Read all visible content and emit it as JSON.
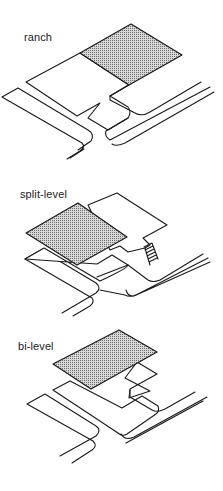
{
  "figure": {
    "panels": [
      {
        "label": "ranch"
      },
      {
        "label": "split-level"
      },
      {
        "label": "bi-level"
      }
    ]
  },
  "colors": {
    "line": "#1a1a1a",
    "fill_dots": "#8a8a8a",
    "background": "#ffffff"
  }
}
